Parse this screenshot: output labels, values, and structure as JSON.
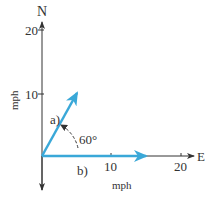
{
  "diagram": {
    "axes": {
      "north_label": "N",
      "east_label": "E",
      "y_unit_label": "mph",
      "x_unit_label": "mph",
      "y_ticks": [
        "10",
        "20"
      ],
      "x_ticks": [
        "10",
        "20"
      ]
    },
    "vectors": [
      {
        "label": "a)",
        "magnitude_mph": 10,
        "angle_deg": 60,
        "color": "#3aa8d8"
      },
      {
        "label": "b)",
        "magnitude_mph": 15,
        "angle_deg": 0,
        "color": "#3aa8d8"
      }
    ],
    "angle_label": "60°",
    "axis_color": "#333333"
  }
}
